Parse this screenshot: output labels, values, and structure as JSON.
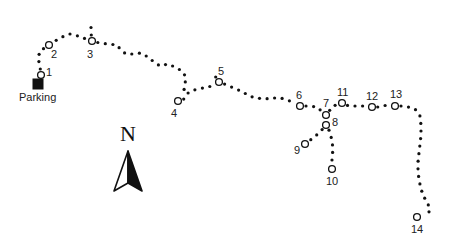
{
  "map": {
    "colors": {
      "trail": "#111111",
      "background": "#ffffff",
      "parking": "#111111"
    },
    "parking": {
      "label": "Parking",
      "x": 38,
      "y": 84,
      "label_x": 19,
      "label_y": 92
    },
    "north_arrow": {
      "label": "N",
      "x": 128,
      "y": 183
    },
    "waypoints": [
      {
        "id": "1",
        "label": "1",
        "x": 41,
        "y": 75,
        "lx": 46,
        "ly": 67
      },
      {
        "id": "2",
        "label": "2",
        "x": 49,
        "y": 45,
        "lx": 51,
        "ly": 49
      },
      {
        "id": "3",
        "label": "3",
        "x": 92,
        "y": 41,
        "lx": 87,
        "ly": 49
      },
      {
        "id": "4",
        "label": "4",
        "x": 178,
        "y": 101,
        "lx": 171,
        "ly": 108
      },
      {
        "id": "5",
        "label": "5",
        "x": 219,
        "y": 82,
        "lx": 218,
        "ly": 66
      },
      {
        "id": "6",
        "label": "6",
        "x": 300,
        "y": 106,
        "lx": 296,
        "ly": 90
      },
      {
        "id": "7",
        "label": "7",
        "x": 326,
        "y": 115,
        "lx": 323,
        "ly": 98
      },
      {
        "id": "8",
        "label": "8",
        "x": 326,
        "y": 125,
        "lx": 332,
        "ly": 117
      },
      {
        "id": "9",
        "label": "9",
        "x": 305,
        "y": 144,
        "lx": 294,
        "ly": 145
      },
      {
        "id": "10",
        "label": "10",
        "x": 332,
        "y": 169,
        "lx": 326,
        "ly": 176
      },
      {
        "id": "11",
        "label": "11",
        "x": 342,
        "y": 103,
        "lx": 337,
        "ly": 87
      },
      {
        "id": "12",
        "label": "12",
        "x": 372,
        "y": 107,
        "lx": 366,
        "ly": 91
      },
      {
        "id": "13",
        "label": "13",
        "x": 395,
        "y": 106,
        "lx": 390,
        "ly": 89
      },
      {
        "id": "14",
        "label": "14",
        "x": 417,
        "y": 217,
        "lx": 411,
        "ly": 224
      }
    ],
    "trails": [
      {
        "name": "parking-to-3",
        "points": [
          [
            41,
            75
          ],
          [
            40,
            66
          ],
          [
            38,
            58
          ],
          [
            40,
            51
          ],
          [
            49,
            45
          ],
          [
            55,
            41
          ],
          [
            62,
            37
          ],
          [
            70,
            34
          ],
          [
            78,
            36
          ],
          [
            86,
            39
          ],
          [
            92,
            41
          ]
        ]
      },
      {
        "name": "spur-north-of-3",
        "points": [
          [
            92,
            41
          ],
          [
            91,
            33
          ],
          [
            91,
            25
          ],
          [
            91,
            17
          ]
        ]
      },
      {
        "name": "3-to-4",
        "points": [
          [
            92,
            41
          ],
          [
            100,
            43
          ],
          [
            108,
            44
          ],
          [
            117,
            45
          ],
          [
            121,
            50
          ],
          [
            126,
            54
          ],
          [
            133,
            54
          ],
          [
            141,
            53
          ],
          [
            148,
            57
          ],
          [
            154,
            62
          ],
          [
            160,
            66
          ],
          [
            168,
            64
          ],
          [
            175,
            67
          ],
          [
            182,
            71
          ],
          [
            186,
            77
          ],
          [
            185,
            84
          ],
          [
            184,
            90
          ],
          [
            180,
            95
          ],
          [
            178,
            101
          ]
        ]
      },
      {
        "name": "4-to-5",
        "points": [
          [
            178,
            101
          ],
          [
            184,
            99
          ],
          [
            188,
            93
          ],
          [
            194,
            90
          ],
          [
            203,
            88
          ],
          [
            212,
            86
          ],
          [
            219,
            82
          ]
        ]
      },
      {
        "name": "spur-at-5",
        "points": [
          [
            219,
            82
          ],
          [
            215,
            76
          ],
          [
            211,
            70
          ]
        ]
      },
      {
        "name": "5-to-6",
        "points": [
          [
            219,
            82
          ],
          [
            227,
            85
          ],
          [
            236,
            89
          ],
          [
            243,
            92
          ],
          [
            249,
            96
          ],
          [
            257,
            98
          ],
          [
            265,
            99
          ],
          [
            273,
            98
          ],
          [
            281,
            98
          ],
          [
            290,
            101
          ],
          [
            300,
            106
          ]
        ]
      },
      {
        "name": "6-to-7",
        "points": [
          [
            300,
            106
          ],
          [
            308,
            106
          ],
          [
            317,
            107
          ],
          [
            326,
            115
          ]
        ]
      },
      {
        "name": "7-to-11",
        "points": [
          [
            326,
            115
          ],
          [
            333,
            106
          ],
          [
            342,
            103
          ]
        ]
      },
      {
        "name": "7-to-8",
        "points": [
          [
            326,
            115
          ],
          [
            326,
            125
          ]
        ]
      },
      {
        "name": "8-to-9",
        "points": [
          [
            326,
            125
          ],
          [
            320,
            132
          ],
          [
            313,
            138
          ],
          [
            305,
            144
          ]
        ]
      },
      {
        "name": "8-to-10",
        "points": [
          [
            326,
            125
          ],
          [
            330,
            132
          ],
          [
            332,
            141
          ],
          [
            333,
            149
          ],
          [
            332,
            157
          ],
          [
            332,
            169
          ]
        ]
      },
      {
        "name": "11-to-13",
        "points": [
          [
            342,
            103
          ],
          [
            349,
            106
          ],
          [
            357,
            106
          ],
          [
            365,
            106
          ],
          [
            372,
            107
          ],
          [
            380,
            107
          ],
          [
            387,
            105
          ],
          [
            395,
            106
          ]
        ]
      },
      {
        "name": "13-to-14",
        "points": [
          [
            395,
            106
          ],
          [
            402,
            106
          ],
          [
            408,
            107
          ],
          [
            415,
            109
          ],
          [
            420,
            116
          ],
          [
            421,
            125
          ],
          [
            421,
            135
          ],
          [
            420,
            144
          ],
          [
            419,
            153
          ],
          [
            418,
            162
          ],
          [
            418,
            171
          ],
          [
            419,
            180
          ],
          [
            421,
            189
          ],
          [
            424,
            197
          ],
          [
            428,
            204
          ],
          [
            430,
            211
          ],
          [
            425,
            215
          ],
          [
            417,
            217
          ]
        ]
      }
    ]
  }
}
